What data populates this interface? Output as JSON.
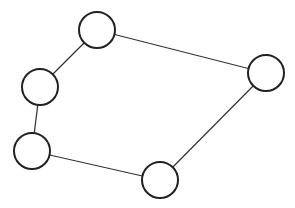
{
  "diagram": {
    "type": "graph",
    "stroke_color": "#222222",
    "edge_color": "#333333",
    "node_radius": 18,
    "nodes": [
      {
        "id": "n1",
        "x": 97,
        "y": 30
      },
      {
        "id": "n2",
        "x": 40,
        "y": 87
      },
      {
        "id": "n3",
        "x": 32,
        "y": 151
      },
      {
        "id": "n4",
        "x": 160,
        "y": 180
      },
      {
        "id": "n5",
        "x": 266,
        "y": 73
      }
    ],
    "edges": [
      [
        "n1",
        "n2"
      ],
      [
        "n2",
        "n3"
      ],
      [
        "n3",
        "n4"
      ],
      [
        "n4",
        "n5"
      ],
      [
        "n5",
        "n1"
      ]
    ]
  }
}
